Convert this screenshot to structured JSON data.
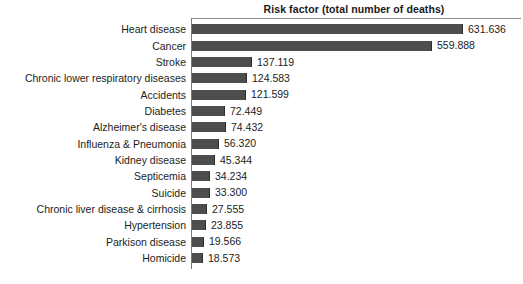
{
  "chart_data": {
    "type": "bar",
    "orientation": "horizontal",
    "title": "Risk factor (total number of deaths)",
    "xlabel": "",
    "ylabel": "",
    "grid": false,
    "legend": null,
    "axis_line_color": "#7a7a7a",
    "bar_color": "#4d4d4d",
    "value_label_separator": ".",
    "xlim": [
      0,
      631636
    ],
    "categories": [
      "Heart disease",
      "Cancer",
      "Stroke",
      "Chronic lower respiratory diseases",
      "Accidents",
      "Diabetes",
      "Alzheimer's disease",
      "Influenza & Pneumonia",
      "Kidney disease",
      "Septicemia",
      "Suicide",
      "Chronic liver disease & cirrhosis",
      "Hypertension",
      "Parkison disease",
      "Homicide"
    ],
    "values": [
      631636,
      559888,
      137119,
      124583,
      121599,
      72449,
      74432,
      56320,
      45344,
      34234,
      33300,
      27555,
      23855,
      19566,
      18573
    ],
    "value_labels": [
      "631.636",
      "559.888",
      "137.119",
      "124.583",
      "121.599",
      "72.449",
      "74.432",
      "56.320",
      "45.344",
      "34.234",
      "33.300",
      "27.555",
      "23.855",
      "19.566",
      "18.573"
    ],
    "bar_pixel_widths": [
      271,
      240,
      60,
      55,
      54,
      33,
      34,
      27,
      23,
      18,
      18,
      15,
      14,
      12,
      11
    ]
  }
}
